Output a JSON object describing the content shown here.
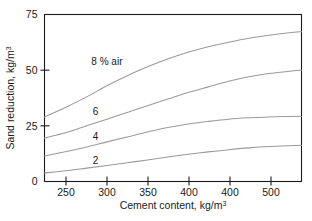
{
  "chart_data": {
    "type": "line",
    "title": "",
    "xlabel": "Cement content, kg/m",
    "xlabel_sup": "3",
    "ylabel": "Sand reduction, kg/m",
    "ylabel_sup": "3",
    "xlim": [
      223,
      540
    ],
    "ylim": [
      0,
      75
    ],
    "grid": false,
    "legend_position": "inline-curve-labels",
    "xticks": [
      250,
      300,
      350,
      400,
      400,
      500
    ],
    "xtick_labels": [
      "250",
      "300",
      "350",
      "400",
      "400",
      "500"
    ],
    "yticks": [
      0,
      25,
      50,
      75
    ],
    "ytick_labels": [
      "0",
      "25",
      "50",
      "75"
    ],
    "line_color": "#9a9a9a",
    "axis_color": "#1a1a1a",
    "background_color": "#ffffff",
    "series": [
      {
        "name": "8 % air",
        "label": "8 % air",
        "x": [
          223,
          250,
          275,
          300,
          325,
          350,
          375,
          400,
          425,
          450,
          475,
          500,
          525,
          540
        ],
        "values": [
          29.0,
          33.5,
          38.0,
          43.0,
          47.5,
          51.5,
          55.0,
          58.0,
          60.5,
          62.5,
          64.3,
          65.7,
          66.8,
          67.3
        ]
      },
      {
        "name": "6",
        "label": "6",
        "x": [
          223,
          250,
          275,
          300,
          325,
          350,
          375,
          400,
          425,
          450,
          475,
          500,
          525,
          540
        ],
        "values": [
          19.5,
          22.0,
          25.0,
          28.0,
          31.0,
          34.0,
          37.0,
          40.0,
          42.5,
          45.0,
          47.0,
          48.5,
          49.5,
          50.0
        ]
      },
      {
        "name": "4",
        "label": "4",
        "x": [
          223,
          250,
          275,
          300,
          325,
          350,
          375,
          400,
          425,
          450,
          475,
          500,
          525,
          540
        ],
        "values": [
          11.5,
          13.5,
          15.5,
          17.8,
          20.0,
          22.2,
          24.2,
          25.8,
          27.0,
          28.0,
          28.6,
          29.0,
          29.2,
          29.3
        ]
      },
      {
        "name": "2",
        "label": "2",
        "x": [
          223,
          250,
          275,
          300,
          325,
          350,
          375,
          400,
          425,
          450,
          475,
          500,
          525,
          540
        ],
        "values": [
          3.8,
          4.8,
          6.0,
          7.2,
          8.4,
          9.7,
          11.0,
          12.2,
          13.3,
          14.3,
          15.1,
          15.7,
          16.1,
          16.3
        ]
      }
    ],
    "annotations": [
      {
        "text": "8 % air",
        "x": 300,
        "y": 52.5
      },
      {
        "text": "6",
        "x": 286,
        "y": 30.0
      },
      {
        "text": "4",
        "x": 286,
        "y": 18.5
      },
      {
        "text": "2",
        "x": 286,
        "y": 8.0
      }
    ]
  }
}
